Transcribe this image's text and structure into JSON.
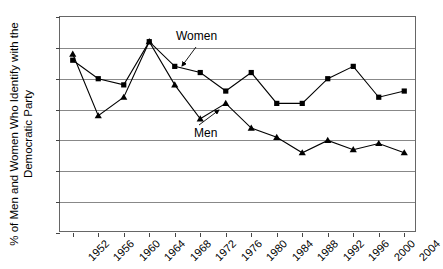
{
  "chart_data": {
    "type": "line",
    "title": "",
    "xlabel": "",
    "ylabel": "% of Men and Women Who Identify with the Democratic Party",
    "ylabel_line1": "% of Men and Women Who Identify with the",
    "ylabel_line2": "Democratic Party",
    "categories": [
      "1952",
      "1956",
      "1960",
      "1964",
      "1968",
      "1972",
      "1976",
      "1980",
      "1984",
      "1988",
      "1992",
      "1996",
      "2000",
      "2004"
    ],
    "ylim": [
      30,
      65
    ],
    "yticks": [
      65,
      60,
      55,
      50,
      45,
      40,
      35,
      30
    ],
    "grid": "horizontal",
    "legend_position": "annotations-on-plot",
    "series": [
      {
        "name": "Women",
        "marker": "square",
        "values": [
          58,
          55,
          54,
          61,
          57,
          56,
          53,
          56,
          51,
          51,
          55,
          57,
          52,
          53
        ]
      },
      {
        "name": "Men",
        "marker": "triangle",
        "values": [
          59,
          49,
          52,
          61,
          54,
          48.5,
          51,
          47,
          45.5,
          43,
          45,
          43.5,
          44.5,
          43
        ]
      }
    ],
    "annotations": [
      {
        "text": "Women",
        "points_to_series": "Women",
        "points_to_category": "1968"
      },
      {
        "text": "Men",
        "points_to_series": "Men",
        "points_to_category": "1976"
      }
    ]
  }
}
